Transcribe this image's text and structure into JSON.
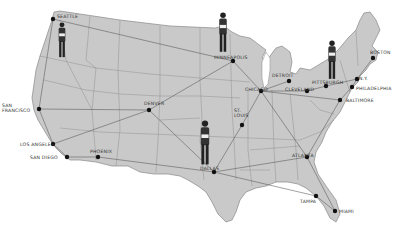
{
  "map": {
    "type": "US airline route map (illustration)",
    "land_color": "#c9c9c9",
    "border_color": "#777777",
    "route_color": "#555555",
    "dot_color": "#111111",
    "cities": [
      {
        "id": "seattle",
        "label": "SEATTLE",
        "x": 53,
        "y": 19,
        "lx": 57,
        "ly": 14
      },
      {
        "id": "san-francisco",
        "label": "SAN FRANCISCO",
        "x": 39,
        "y": 109,
        "lx": 2,
        "ly": 103,
        "multiline": [
          "SAN",
          "FRANCISCO"
        ]
      },
      {
        "id": "los-angeles",
        "label": "LOS ANGELES",
        "x": 53,
        "y": 144,
        "lx": 20,
        "ly": 142
      },
      {
        "id": "san-diego",
        "label": "SAN DIEGO",
        "x": 67,
        "y": 157,
        "lx": 30,
        "ly": 155
      },
      {
        "id": "phoenix",
        "label": "PHOENIX",
        "x": 98,
        "y": 157,
        "lx": 90,
        "ly": 149
      },
      {
        "id": "denver",
        "label": "DENVER",
        "x": 149,
        "y": 110,
        "lx": 144,
        "ly": 101
      },
      {
        "id": "minneapolis",
        "label": "MINNEAPOLIS",
        "x": 233,
        "y": 61,
        "lx": 214,
        "ly": 55
      },
      {
        "id": "dallas",
        "label": "DALLAS",
        "x": 214,
        "y": 172,
        "lx": 200,
        "ly": 166
      },
      {
        "id": "st-louis",
        "label": "ST. LOUIS",
        "x": 242,
        "y": 125,
        "lx": 234,
        "ly": 108,
        "multiline": [
          "ST.",
          "LOUIS"
        ]
      },
      {
        "id": "chicago",
        "label": "CHICAGO",
        "x": 261,
        "y": 91,
        "lx": 245,
        "ly": 87
      },
      {
        "id": "detroit",
        "label": "DETROIT",
        "x": 289,
        "y": 81,
        "lx": 272,
        "ly": 73
      },
      {
        "id": "cleveland",
        "label": "CLEVELAND",
        "x": 307,
        "y": 91,
        "lx": 285,
        "ly": 87
      },
      {
        "id": "pittsburgh",
        "label": "PITTSBURGH",
        "x": 326,
        "y": 86,
        "lx": 312,
        "ly": 80
      },
      {
        "id": "new-york",
        "label": "N.Y.",
        "x": 357,
        "y": 79,
        "lx": 359,
        "ly": 76
      },
      {
        "id": "philadelphia",
        "label": "PHILADELPHIA",
        "x": 352,
        "y": 87,
        "lx": 356,
        "ly": 86
      },
      {
        "id": "baltimore",
        "label": "BALTIMORE",
        "x": 340,
        "y": 100,
        "lx": 346,
        "ly": 98
      },
      {
        "id": "boston",
        "label": "BOSTON",
        "x": 373,
        "y": 58,
        "lx": 370,
        "ly": 50
      },
      {
        "id": "atlanta",
        "label": "ATLANTA",
        "x": 307,
        "y": 157,
        "lx": 292,
        "ly": 153
      },
      {
        "id": "tampa",
        "label": "TAMPA",
        "x": 316,
        "y": 196,
        "lx": 300,
        "ly": 199
      },
      {
        "id": "miami",
        "label": "MIAMI",
        "x": 335,
        "y": 211,
        "lx": 339,
        "ly": 209
      }
    ],
    "routes": [
      [
        "seattle",
        "minneapolis"
      ],
      [
        "seattle",
        "san-francisco"
      ],
      [
        "san-francisco",
        "los-angeles"
      ],
      [
        "san-francisco",
        "denver"
      ],
      [
        "los-angeles",
        "san-diego"
      ],
      [
        "los-angeles",
        "denver"
      ],
      [
        "san-diego",
        "phoenix"
      ],
      [
        "phoenix",
        "dallas"
      ],
      [
        "denver",
        "minneapolis"
      ],
      [
        "denver",
        "dallas"
      ],
      [
        "minneapolis",
        "chicago"
      ],
      [
        "chicago",
        "atlanta"
      ],
      [
        "chicago",
        "detroit"
      ],
      [
        "chicago",
        "cleveland"
      ],
      [
        "chicago",
        "baltimore"
      ],
      [
        "dallas",
        "st-louis"
      ],
      [
        "dallas",
        "tampa"
      ],
      [
        "dallas",
        "atlanta"
      ],
      [
        "st-louis",
        "chicago"
      ],
      [
        "cleveland",
        "pittsburgh"
      ],
      [
        "pittsburgh",
        "new-york"
      ],
      [
        "baltimore",
        "philadelphia"
      ],
      [
        "philadelphia",
        "new-york"
      ],
      [
        "new-york",
        "boston"
      ],
      [
        "atlanta",
        "baltimore"
      ],
      [
        "tampa",
        "miami"
      ],
      [
        "atlanta",
        "miami"
      ]
    ],
    "figures": [
      {
        "id": "businessman-seattle",
        "desc": "man holding papers",
        "x": 62,
        "y": 22,
        "h": 38
      },
      {
        "id": "businessman-minneapolis",
        "desc": "man in hat and coat",
        "x": 223,
        "y": 12,
        "h": 43
      },
      {
        "id": "businessman-new-york",
        "desc": "man with briefcase",
        "x": 332,
        "y": 40,
        "h": 42
      },
      {
        "id": "businessman-running",
        "desc": "man running with briefcase",
        "x": 205,
        "y": 120,
        "h": 48
      }
    ]
  }
}
